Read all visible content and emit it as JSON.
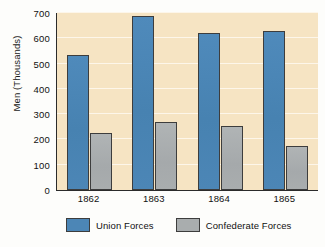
{
  "chart_data": {
    "type": "bar",
    "title": "",
    "xlabel": "",
    "ylabel": "Men (Thousands)",
    "categories": [
      "1862",
      "1863",
      "1864",
      "1865"
    ],
    "series": [
      {
        "name": "Union Forces",
        "color": "#4c86b6",
        "values": [
          535,
          690,
          620,
          630
        ]
      },
      {
        "name": "Confederate Forces",
        "color": "#a9adae",
        "values": [
          225,
          270,
          255,
          175
        ]
      }
    ],
    "ylim": [
      0,
      700
    ],
    "y_ticks": [
      0,
      100,
      200,
      300,
      400,
      500,
      600,
      700
    ],
    "y_tick_labels": [
      "0",
      "100",
      "200",
      "300",
      "400",
      "500",
      "600",
      "700"
    ],
    "grid": true,
    "grid_axis": "y",
    "legend_position": "bottom",
    "plot_background": "#f6e4c3",
    "gridline_color": "#fdf6ea",
    "axis_color": "#2b2b2b"
  },
  "legend": {
    "items": [
      {
        "label": "Union Forces"
      },
      {
        "label": "Confederate Forces"
      }
    ]
  }
}
